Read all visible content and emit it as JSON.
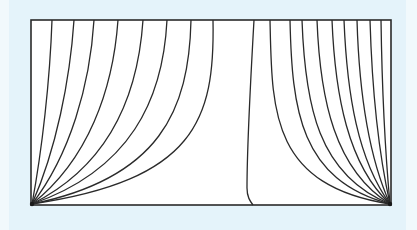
{
  "figure": {
    "colors": {
      "background": "#e4f3fa",
      "panel": "#ffffff",
      "stroke": "#2a2a2a"
    },
    "rectangle": {
      "x": 31,
      "y": 20,
      "width": 360,
      "height": 185
    },
    "left_source": {
      "x": 32,
      "y": 204
    },
    "right_source": {
      "x": 390,
      "y": 204
    },
    "left_curves_top_x": [
      52,
      74,
      94,
      118,
      143,
      167,
      191,
      213
    ],
    "right_curves_top_x": [
      270,
      290,
      302,
      317,
      332,
      344,
      357,
      370,
      381
    ],
    "separatrix": {
      "top_x": 254,
      "bottom_x": 253
    }
  }
}
